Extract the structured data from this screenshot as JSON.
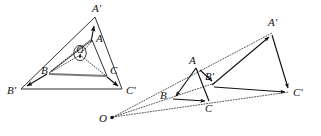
{
  "figure": {
    "background_color": "#ffffff",
    "line_color": "#1a1a1a",
    "gray_segment_color": "#7a7a7a",
    "width": 321,
    "height": 136
  },
  "left_diagram": {
    "name": "rotation-about-center-O",
    "center_label": "O",
    "center_point": {
      "x": 80,
      "y": 55
    },
    "vertices": [
      {
        "label": "A",
        "x": 92,
        "y": 40,
        "label_x": 96,
        "label_y": 42
      },
      {
        "label": "B",
        "x": 49,
        "y": 73,
        "label_x": 41,
        "label_y": 74
      },
      {
        "label": "C",
        "x": 107,
        "y": 76,
        "label_x": 110,
        "label_y": 74
      },
      {
        "label": "A'",
        "x": 95,
        "y": 17,
        "label_x": 92,
        "label_y": 12
      },
      {
        "label": "B'",
        "x": 21,
        "y": 89,
        "label_x": 9,
        "label_y": 94
      },
      {
        "label": "C'",
        "x": 122,
        "y": 89,
        "label_x": 126,
        "label_y": 94
      }
    ],
    "inner_triangle_edges": [
      "A-B",
      "B-C",
      "C-A"
    ],
    "outer_triangle_edges": [
      "A'-B'",
      "B'-C'",
      "C'-A'"
    ],
    "vector_arrows": [
      "B->B'",
      "C->C'",
      "A->A'"
    ],
    "spokes_from_center": [
      "O-A",
      "O-B",
      "O-C"
    ],
    "gray_segment": "B-C",
    "arrow_style": "filled-triangle-head"
  },
  "right_diagram": {
    "name": "homothety-from-point-O",
    "center_label": "O",
    "center_point": {
      "x": 111,
      "y": 118
    },
    "vertices": [
      {
        "label": "A",
        "x": 196,
        "y": 68,
        "label_x": 190,
        "label_y": 63
      },
      {
        "label": "B",
        "x": 173,
        "y": 98,
        "label_x": 162,
        "label_y": 99
      },
      {
        "label": "C",
        "x": 209,
        "y": 101,
        "label_x": 208,
        "label_y": 110
      },
      {
        "label": "A'",
        "x": 272,
        "y": 33,
        "label_x": 270,
        "label_y": 26
      },
      {
        "label": "B'",
        "x": 213,
        "y": 84,
        "label_x": 206,
        "label_y": 79
      },
      {
        "label": "C'",
        "x": 289,
        "y": 92,
        "label_x": 293,
        "label_y": 95
      }
    ],
    "small_triangle_edges": [
      "A-B",
      "B-C",
      "C-A"
    ],
    "large_triangle_edges": [
      "A'-B'",
      "B'-C'",
      "C'-A'"
    ],
    "vector_arrows": [
      "B'->A'",
      "B'->C'",
      "A'->C'",
      "B->C",
      "A->B",
      "B'->B'"
    ],
    "rays_from_O": [
      "O-A-A'",
      "O-B-B'",
      "O-C-C'"
    ],
    "ray_style": "dotted",
    "arrow_style": "filled-triangle-head"
  }
}
